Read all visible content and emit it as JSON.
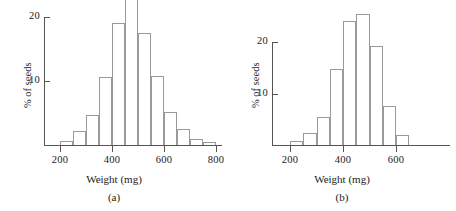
{
  "figure": {
    "background": "#ffffff",
    "bar_outline_color": "#9a9a9a",
    "axis_color": "#555555",
    "text_color": "#1a1a1a"
  },
  "panels": [
    {
      "caption": "(a)",
      "ylabel": "% of seeds",
      "xlabel": "Weight (mg)",
      "ytick_labels": [
        "10",
        "20"
      ],
      "xtick_labels": [
        "200",
        "400",
        "600",
        "800"
      ]
    },
    {
      "caption": "(b)",
      "ylabel": "% of seeds",
      "xlabel": "Weight (mg)",
      "ytick_labels": [
        "10",
        "20"
      ],
      "xtick_labels": [
        "200",
        "400",
        "600"
      ]
    }
  ],
  "chart_data": [
    {
      "type": "bar",
      "title": "(a)",
      "xlabel": "Weight (mg)",
      "ylabel": "% of seeds",
      "xlim": [
        175,
        825
      ],
      "ylim": [
        0,
        24
      ],
      "xticks": [
        200,
        400,
        600,
        800
      ],
      "yticks": [
        10,
        20
      ],
      "grid": false,
      "legend": false,
      "bin_width": 50,
      "bin_edges": [
        200,
        250,
        300,
        350,
        400,
        450,
        500,
        550,
        600,
        650,
        700,
        750,
        800
      ],
      "categories": [
        "200-250",
        "250-300",
        "300-350",
        "350-400",
        "400-450",
        "450-500",
        "500-550",
        "550-600",
        "600-650",
        "650-700",
        "700-750",
        "750-800"
      ],
      "values": [
        0.6,
        2.2,
        4.7,
        10.7,
        19.0,
        23.2,
        17.5,
        10.8,
        5.2,
        2.5,
        0.9,
        0.4
      ]
    },
    {
      "type": "bar",
      "title": "(b)",
      "xlabel": "Weight (mg)",
      "ylabel": "% of seeds",
      "xlim": [
        175,
        675
      ],
      "ylim": [
        0,
        26
      ],
      "xticks": [
        200,
        400,
        600
      ],
      "yticks": [
        10,
        20
      ],
      "grid": false,
      "legend": false,
      "bin_width": 50,
      "bin_edges": [
        200,
        250,
        300,
        350,
        400,
        450,
        500,
        550,
        600,
        650
      ],
      "categories": [
        "200-250",
        "250-300",
        "300-350",
        "350-400",
        "400-450",
        "450-500",
        "500-550",
        "550-600",
        "600-650"
      ],
      "values": [
        0.7,
        2.3,
        5.4,
        14.8,
        24.0,
        25.5,
        19.2,
        7.6,
        2.0
      ]
    }
  ]
}
